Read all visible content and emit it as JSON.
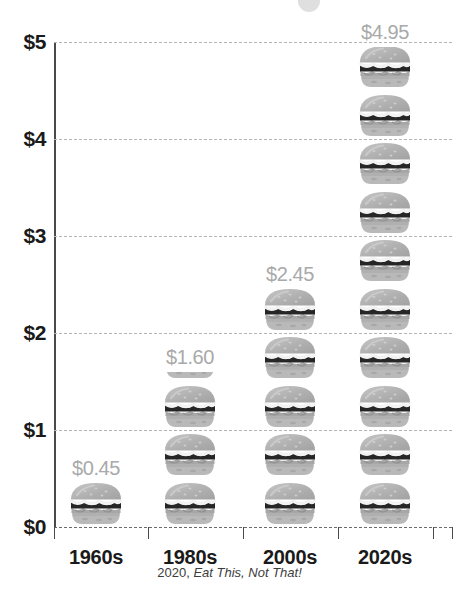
{
  "chart_data": {
    "type": "bar",
    "subtype": "pictograph-burger-stack",
    "title": "",
    "subtitle": "",
    "xlabel": "",
    "ylabel": "",
    "categories": [
      "1960s",
      "1980s",
      "2000s",
      "2020s"
    ],
    "values": [
      0.45,
      1.6,
      2.45,
      4.95
    ],
    "value_labels": [
      "$0.45",
      "$1.60",
      "$2.45",
      "$4.95"
    ],
    "series": [
      {
        "name": "Average burger price",
        "values": [
          0.45,
          1.6,
          2.45,
          4.95
        ]
      }
    ],
    "ylim": [
      0,
      5
    ],
    "y_ticks": [
      0,
      1,
      2,
      3,
      4,
      5
    ],
    "y_tick_labels": [
      "$0",
      "$1",
      "$2",
      "$3",
      "$4",
      "$5"
    ],
    "grid": true,
    "grid_style": "dashed-horizontal",
    "legend": false,
    "legend_position": "none",
    "icon_unit_value": 0.5,
    "icon_name": "burger-icon",
    "icon_counts": [
      0.9,
      3.2,
      4.9,
      9.9
    ],
    "colors": {
      "value_label": "#a9a9a9",
      "axis": "#4a4a4a",
      "gridline": "#b4b4b4",
      "tick_label": "#1a1a1a",
      "icon_light": "#bdbdbd",
      "icon_mid": "#9a9a9a",
      "icon_dark": "#2b2b2b",
      "background": "#ffffff"
    }
  },
  "credit": {
    "year": "2020, ",
    "source": "Eat This, Not That!"
  }
}
